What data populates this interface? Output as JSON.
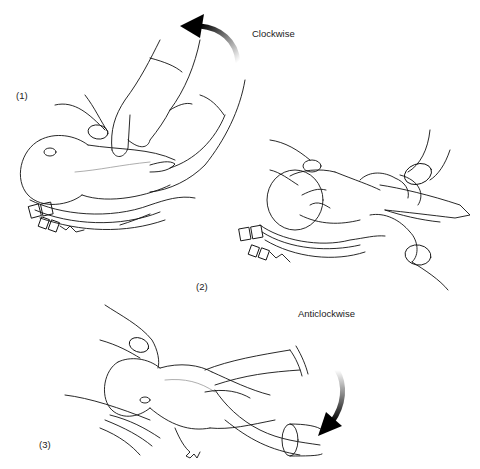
{
  "figure": {
    "panels": [
      {
        "id": 1,
        "number_label": "(1)",
        "direction_label": "Clockwise",
        "arrow_direction": "counter-up-left"
      },
      {
        "id": 2,
        "number_label": "(2)"
      },
      {
        "id": 3,
        "number_label": "(3)",
        "direction_label": "Anticlockwise",
        "arrow_direction": "down-left"
      }
    ],
    "colors": {
      "line": "#111111",
      "background": "#ffffff",
      "arrow": "#000000"
    }
  }
}
